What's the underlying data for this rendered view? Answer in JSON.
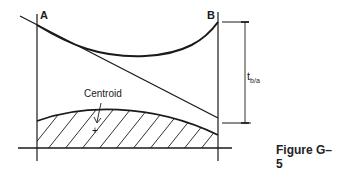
{
  "diagram": {
    "points": {
      "a_label": "A",
      "b_label": "B"
    },
    "centroid_label": "Centroid",
    "centroid_marker": "+",
    "deviation_label": {
      "main": "t",
      "subscript": "b/a"
    },
    "caption": "Figure G–5",
    "colors": {
      "stroke": "#1a1a1a",
      "background": "#ffffff"
    }
  }
}
